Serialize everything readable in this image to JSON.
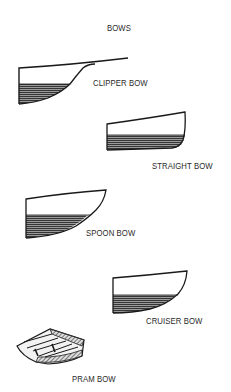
{
  "title": "BOWS",
  "bows": [
    {
      "id": "clipper",
      "label": "CLIPPER BOW"
    },
    {
      "id": "straight",
      "label": "STRAIGHT BOW"
    },
    {
      "id": "spoon",
      "label": "SPOON BOW"
    },
    {
      "id": "cruiser",
      "label": "CRUISER BOW"
    },
    {
      "id": "pram",
      "label": "PRAM BOW"
    }
  ],
  "colors": {
    "ink": "#1a1a1a",
    "hatch": "#555555",
    "background": "#ffffff"
  }
}
